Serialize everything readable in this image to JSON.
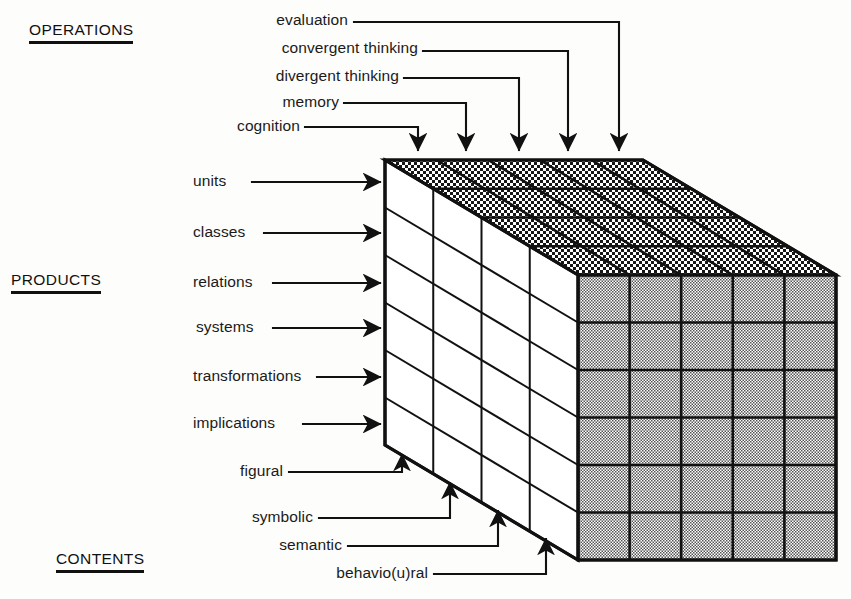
{
  "diagram": {
    "title_operations": "OPERATIONS",
    "title_products": "PRODUCTS",
    "title_contents": "CONTENTS",
    "operations": [
      {
        "label": "evaluation"
      },
      {
        "label": "convergent thinking"
      },
      {
        "label": "divergent thinking"
      },
      {
        "label": "memory"
      },
      {
        "label": "cognition"
      }
    ],
    "products": [
      {
        "label": "units"
      },
      {
        "label": "classes"
      },
      {
        "label": "relations"
      },
      {
        "label": "systems"
      },
      {
        "label": "transformations"
      },
      {
        "label": "implications"
      }
    ],
    "contents": [
      {
        "label": "figural"
      },
      {
        "label": "symbolic"
      },
      {
        "label": "semantic"
      },
      {
        "label": "behavio(u)ral"
      }
    ],
    "colors": {
      "ink": "#111111",
      "front_face": "#ffffff",
      "right_face": "#b9b9b9",
      "top_face": "#4a4a4a",
      "background": "#fdfdfc"
    }
  }
}
